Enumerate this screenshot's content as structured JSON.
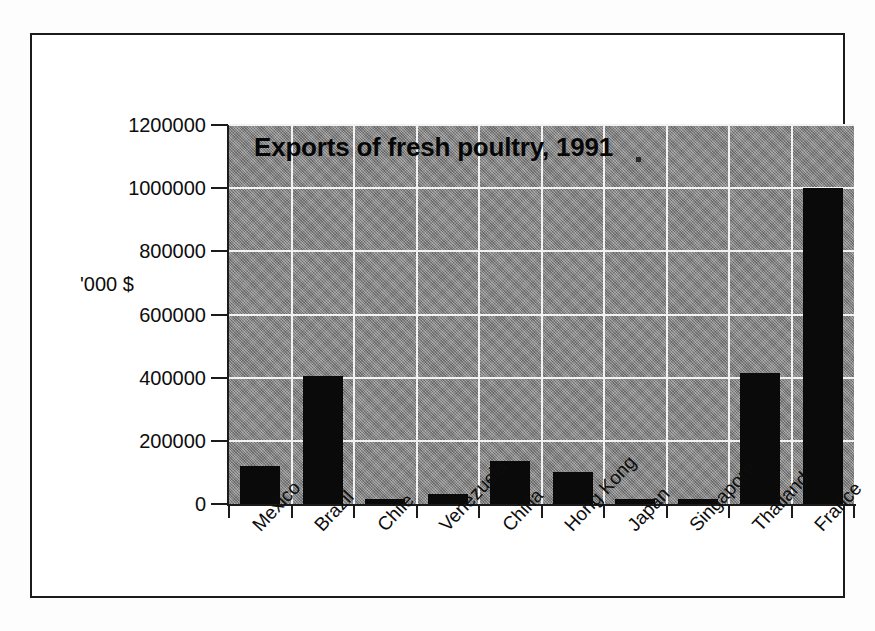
{
  "chart_data": {
    "type": "bar",
    "title": "Exports of fresh poultry, 1991",
    "xlabel": "",
    "ylabel": "'000 $",
    "categories": [
      "Mexico",
      "Brazil",
      "Chile",
      "Venezuela",
      "China",
      "Hong Kong",
      "Japan",
      "Singapore",
      "Thailand",
      "France"
    ],
    "values": [
      120000,
      405000,
      15000,
      32000,
      135000,
      100000,
      15000,
      15000,
      415000,
      1000000
    ],
    "ylim": [
      0,
      1200000
    ],
    "ytick_labels": [
      "0",
      "200000",
      "400000",
      "600000",
      "800000",
      "1000000",
      "1200000"
    ],
    "ytick_values": [
      0,
      200000,
      400000,
      600000,
      800000,
      1000000,
      1200000
    ],
    "grid": true,
    "legend": false,
    "series_color": "#0a0a0a",
    "plot_background": "#8c8c8c",
    "gridline_color": "#f2f2f2"
  },
  "figure": {
    "frame_color": "#1b1b1b",
    "page_background": "#fdfdfd"
  }
}
